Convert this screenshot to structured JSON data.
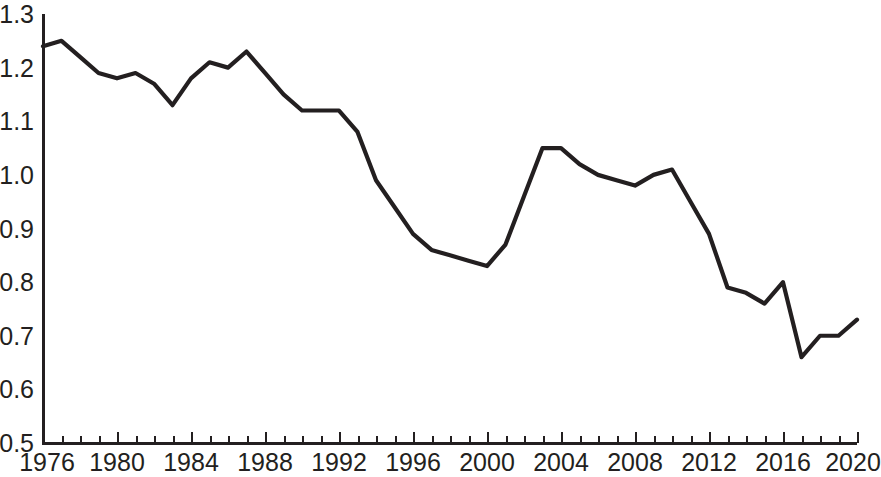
{
  "chart_data": {
    "type": "line",
    "title": "",
    "subtitle": "",
    "xlabel": "",
    "ylabel": "",
    "grid": false,
    "legend": null,
    "xlim": [
      1976,
      2020
    ],
    "ylim": [
      0.5,
      1.3
    ],
    "y_ticks": [
      "1.3",
      "1.2",
      "1.1",
      "1.0",
      "0.9",
      "0.8",
      "0.7",
      "0.6",
      "0.5"
    ],
    "y_tick_values": [
      1.3,
      1.2,
      1.1,
      1.0,
      0.9,
      0.8,
      0.7,
      0.6,
      0.5
    ],
    "x_ticks": [
      "1976",
      "1980",
      "1984",
      "1988",
      "1992",
      "1996",
      "2000",
      "2004",
      "2008",
      "2012",
      "2016",
      "2020"
    ],
    "x_tick_values": [
      1976,
      1980,
      1984,
      1988,
      1992,
      1996,
      2000,
      2004,
      2008,
      2012,
      2016,
      2020
    ],
    "x_minor_tick_interval": 1,
    "line_color": "#231f20",
    "series": [
      {
        "name": "",
        "x": [
          1976,
          1977,
          1978,
          1979,
          1980,
          1981,
          1982,
          1983,
          1984,
          1985,
          1986,
          1987,
          1988,
          1989,
          1990,
          1991,
          1992,
          1993,
          1994,
          1995,
          1996,
          1997,
          1998,
          1999,
          2000,
          2001,
          2002,
          2003,
          2004,
          2005,
          2006,
          2007,
          2008,
          2009,
          2010,
          2011,
          2012,
          2013,
          2014,
          2015,
          2016,
          2017,
          2018,
          2019,
          2020
        ],
        "values": [
          1.24,
          1.25,
          1.22,
          1.19,
          1.18,
          1.19,
          1.17,
          1.13,
          1.18,
          1.21,
          1.2,
          1.23,
          1.19,
          1.15,
          1.12,
          1.12,
          1.12,
          1.08,
          0.99,
          0.94,
          0.89,
          0.86,
          0.85,
          0.84,
          0.83,
          0.87,
          0.96,
          1.05,
          1.05,
          1.02,
          1.0,
          0.99,
          0.98,
          1.0,
          1.01,
          0.95,
          0.89,
          0.79,
          0.78,
          0.76,
          0.8,
          0.66,
          0.7,
          0.7,
          0.73
        ]
      }
    ]
  }
}
